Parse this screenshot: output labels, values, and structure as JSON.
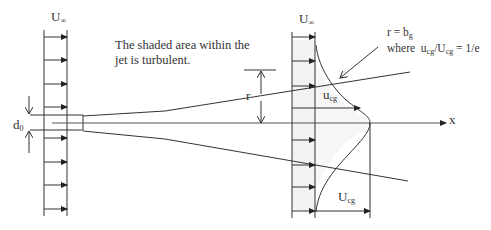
{
  "diagram": {
    "type": "fluid-jet-schematic",
    "left_profile": {
      "label_main": "U",
      "label_sub": "∞"
    },
    "right_profile": {
      "label_main": "U",
      "label_sub": "∞"
    },
    "note_line1": "The shaded area within the",
    "note_line2": "jet is turbulent.",
    "nozzle_diameter": {
      "main": "d",
      "sub": "0"
    },
    "radius_label": "r",
    "local_velocity": {
      "main": "u",
      "sub": "cg"
    },
    "centerline_velocity": {
      "main": "U",
      "sub": "cg"
    },
    "axis_label": "x",
    "definition": {
      "line1_main": "r = b",
      "line1_sub": "g",
      "line2_prefix": "where  u",
      "line2_sub1": "cg",
      "line2_mid": "/U",
      "line2_sub2": "cg",
      "line2_suffix": " = 1/e"
    },
    "colors": {
      "line": "#333333",
      "shade": "#e6e6e6",
      "background": "#ffffff"
    }
  }
}
